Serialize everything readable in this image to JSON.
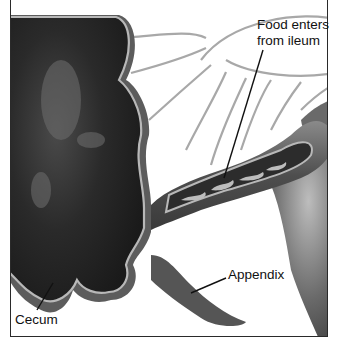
{
  "diagram": {
    "labels": [
      {
        "id": "food",
        "line1": "Food enters",
        "line2": "from ileum"
      },
      {
        "id": "appendix",
        "text": "Appendix"
      },
      {
        "id": "cecum",
        "text": "Cecum"
      }
    ]
  },
  "colors": {
    "background": "#ffffff",
    "lumen": "#262626",
    "wall": "#5c5c5c",
    "lining": "#b8b8b8",
    "mesentery_lines": "#a8a8a8",
    "leader_lines": "#111111",
    "frame": "#2a2a2a"
  }
}
